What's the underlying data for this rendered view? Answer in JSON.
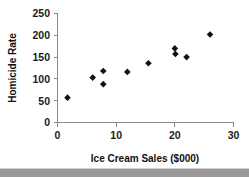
{
  "chart_data": {
    "type": "scatter",
    "title": "",
    "xlabel": "Ice Cream Sales ($000)",
    "ylabel": "Homicide Rate",
    "xlim": [
      0,
      30
    ],
    "ylim": [
      0,
      250
    ],
    "xticks": [
      0,
      10,
      20,
      30
    ],
    "yticks": [
      0,
      50,
      100,
      150,
      200,
      250
    ],
    "xtick_labels": [
      "0",
      "10",
      "20",
      "30"
    ],
    "ytick_labels": [
      "0",
      "50",
      "100",
      "150",
      "200",
      "250"
    ],
    "grid": false,
    "legend": false,
    "marker": "diamond",
    "marker_color": "#111111",
    "axis_color": "#8a8a8a",
    "points": [
      {
        "x": 1.7,
        "y": 57
      },
      {
        "x": 6.0,
        "y": 103
      },
      {
        "x": 7.8,
        "y": 118
      },
      {
        "x": 7.8,
        "y": 88
      },
      {
        "x": 11.9,
        "y": 116
      },
      {
        "x": 15.5,
        "y": 136
      },
      {
        "x": 20.0,
        "y": 170
      },
      {
        "x": 20.1,
        "y": 157
      },
      {
        "x": 22.0,
        "y": 150
      },
      {
        "x": 26.0,
        "y": 202
      }
    ]
  },
  "figure": {
    "background_color": "#ffffff",
    "footer_bar_color": "#9a9a9a"
  }
}
